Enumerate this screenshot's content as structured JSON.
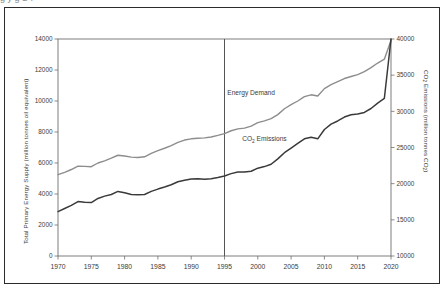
{
  "figure": {
    "top_fragment": "g                                             y        g       S  I",
    "background": "#ffffff",
    "border_color": "#2b2b2b"
  },
  "chart_data": {
    "type": "line",
    "title": "",
    "subtitle": "",
    "xlabel": "",
    "ylabel": "Total Primary Energy Supply (million tonnes oil equivalent)",
    "y2label": "CO2 Emissions (million tonnes CO2)",
    "ylabel_parts": {
      "pre": "Total Primary Energy Supply (million tonnes oil equivalent)"
    },
    "y2label_parts": {
      "a": "CO",
      "sub1": "2",
      "b": " Emissions (million tonnes CO",
      "sub2": "2",
      "c": ")"
    },
    "grid": false,
    "legend": "inline-annotations",
    "xlim": [
      1970,
      2020
    ],
    "ylim": [
      0,
      14000
    ],
    "y2lim": [
      10000,
      40000
    ],
    "xticks": [
      1970,
      1975,
      1980,
      1985,
      1990,
      1995,
      2000,
      2005,
      2010,
      2015,
      2020
    ],
    "xticklabels": [
      "1970",
      "1975",
      "1980",
      "1985",
      "1990",
      "1995",
      "2000",
      "2005",
      "2010",
      "2015",
      "2020"
    ],
    "yticks": [
      0,
      2000,
      4000,
      6000,
      8000,
      10000,
      12000,
      14000
    ],
    "yticklabels": [
      "0",
      "2000",
      "4000",
      "6000",
      "8000",
      "10000",
      "12000",
      "14000"
    ],
    "y2ticks": [
      10000,
      15000,
      20000,
      25000,
      30000,
      35000,
      40000
    ],
    "y2ticklabels": [
      "10000",
      "15000",
      "20000",
      "25000",
      "30000",
      "35000",
      "40000"
    ],
    "divider_x": 1995,
    "divider_color": "#555555",
    "series": [
      {
        "name": "Energy Demand",
        "axis": "left",
        "color": "#8d8d8d",
        "width": 1.4,
        "label_x": 1999,
        "label_y": 10400,
        "x": [
          1970,
          1971,
          1972,
          1973,
          1974,
          1975,
          1976,
          1977,
          1978,
          1979,
          1980,
          1981,
          1982,
          1983,
          1984,
          1985,
          1986,
          1987,
          1988,
          1989,
          1990,
          1991,
          1992,
          1993,
          1994,
          1995,
          1996,
          1997,
          1998,
          1999,
          2000,
          2001,
          2002,
          2003,
          2004,
          2005,
          2006,
          2007,
          2008,
          2009,
          2010,
          2011,
          2012,
          2013,
          2014,
          2015,
          2016,
          2017,
          2018,
          2019,
          2020
        ],
        "values": [
          5250,
          5400,
          5580,
          5800,
          5780,
          5760,
          6000,
          6140,
          6310,
          6500,
          6450,
          6380,
          6350,
          6400,
          6620,
          6800,
          6950,
          7120,
          7330,
          7480,
          7560,
          7600,
          7620,
          7680,
          7780,
          7900,
          8080,
          8200,
          8250,
          8380,
          8600,
          8720,
          8860,
          9120,
          9500,
          9760,
          10000,
          10280,
          10400,
          10320,
          10800,
          11060,
          11250,
          11450,
          11580,
          11700,
          11900,
          12150,
          12450,
          12700,
          13900
        ]
      },
      {
        "name": "CO2 Emissions",
        "axis": "right",
        "color": "#3a3a3a",
        "width": 1.5,
        "label_x": 2001,
        "label_y_left_units": 7400,
        "x": [
          1970,
          1971,
          1972,
          1973,
          1974,
          1975,
          1976,
          1977,
          1978,
          1979,
          1980,
          1981,
          1982,
          1983,
          1984,
          1985,
          1986,
          1987,
          1988,
          1989,
          1990,
          1991,
          1992,
          1993,
          1994,
          1995,
          1996,
          1997,
          1998,
          1999,
          2000,
          2001,
          2002,
          2003,
          2004,
          2005,
          2006,
          2007,
          2008,
          2009,
          2010,
          2011,
          2012,
          2013,
          2014,
          2015,
          2016,
          2017,
          2018,
          2019,
          2020
        ],
        "values_left_units": [
          2400,
          2600,
          2800,
          3050,
          3000,
          2980,
          3250,
          3400,
          3500,
          3700,
          3620,
          3500,
          3480,
          3500,
          3700,
          3850,
          3980,
          4130,
          4320,
          4420,
          4500,
          4520,
          4480,
          4520,
          4600,
          4700,
          4850,
          4950,
          4960,
          5000,
          5200,
          5300,
          5450,
          5800,
          6200,
          6500,
          6800,
          7100,
          7200,
          7100,
          7700,
          8050,
          8250,
          8500,
          8650,
          8700,
          8800,
          9050,
          9400,
          9700,
          13800
        ],
        "values": [
          16140,
          16570,
          17000,
          17530,
          17420,
          17380,
          17960,
          18280,
          18500,
          18930,
          18750,
          18500,
          18460,
          18500,
          18930,
          19250,
          19530,
          19850,
          20260,
          20470,
          20640,
          20690,
          20600,
          20690,
          20860,
          21070,
          21390,
          21600,
          21620,
          21710,
          22140,
          22360,
          22680,
          23430,
          24280,
          24920,
          25560,
          26200,
          26420,
          26200,
          27490,
          28240,
          28670,
          29210,
          29530,
          29640,
          29850,
          30390,
          31140,
          31780,
          40000
        ]
      }
    ],
    "annotations": [
      {
        "text": "Energy Demand",
        "x": 1999,
        "y": 10400
      },
      {
        "text": "CO2 Emissions",
        "x": 2001,
        "y": 7400,
        "has_subscript": true
      }
    ]
  }
}
